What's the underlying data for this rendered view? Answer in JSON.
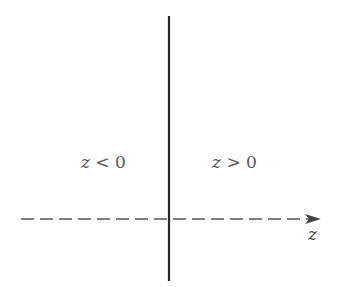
{
  "diagram": {
    "regions": [
      {
        "variable": "z",
        "relation": "<",
        "value": "0",
        "text": "z < 0"
      },
      {
        "variable": "z",
        "relation": ">",
        "value": "0",
        "text": "z > 0"
      }
    ],
    "axis": {
      "label": "z",
      "style": "dashed",
      "direction": "right"
    },
    "boundary": {
      "style": "solid",
      "position": "z = 0"
    },
    "colors": {
      "boundary": "#2a2a2a",
      "axis": "#555555",
      "text": "#555555"
    }
  }
}
